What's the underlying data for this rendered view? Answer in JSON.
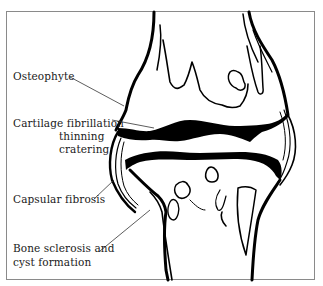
{
  "diagram": {
    "labels": [
      {
        "id": "osteophyte",
        "lines": [
          "Osteophyte"
        ]
      },
      {
        "id": "cartilage",
        "lines": [
          "Cartilage fibrillation",
          "thinning",
          "cratering"
        ]
      },
      {
        "id": "capsular",
        "lines": [
          "Capsular fibrosis"
        ]
      },
      {
        "id": "bone",
        "lines": [
          "Bone sclerosis and",
          "cyst formation"
        ]
      }
    ],
    "colors": {
      "ink": "#000000",
      "frame": "#8a8a8a",
      "background": "#ffffff"
    }
  }
}
